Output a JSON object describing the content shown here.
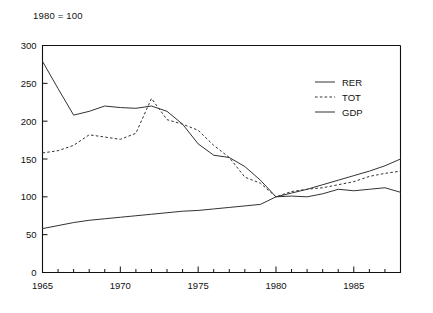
{
  "chart_data": {
    "type": "line",
    "title": "1980 = 100",
    "xlabel": "",
    "ylabel": "",
    "xlim": [
      1965,
      1988
    ],
    "ylim": [
      0,
      300
    ],
    "yticks": [
      0,
      50,
      100,
      150,
      200,
      250,
      300
    ],
    "xticks": [
      1965,
      1970,
      1975,
      1980,
      1985
    ],
    "xticks_minor_step": 1,
    "grid": false,
    "legend_position": "upper right",
    "x": [
      1965,
      1966,
      1967,
      1968,
      1969,
      1970,
      1971,
      1972,
      1973,
      1974,
      1975,
      1976,
      1977,
      1978,
      1979,
      1980,
      1981,
      1982,
      1983,
      1984,
      1985,
      1986,
      1987,
      1988
    ],
    "series": [
      {
        "name": "RER",
        "style": "solid",
        "color": "#333333",
        "values": [
          279,
          243,
          208,
          213,
          220,
          218,
          217,
          220,
          213,
          196,
          170,
          155,
          152,
          140,
          122,
          100,
          101,
          100,
          104,
          110,
          108,
          110,
          112,
          106
        ]
      },
      {
        "name": "TOT",
        "style": "dashed",
        "color": "#555555",
        "values": [
          158,
          161,
          168,
          182,
          179,
          176,
          184,
          230,
          202,
          196,
          188,
          168,
          152,
          126,
          118,
          100,
          107,
          110,
          112,
          116,
          120,
          127,
          131,
          134
        ]
      },
      {
        "name": "GDP",
        "style": "solid",
        "color": "#222222",
        "values": [
          58,
          62,
          66,
          69,
          71,
          73,
          75,
          77,
          79,
          81,
          82,
          84,
          86,
          88,
          90,
          100,
          105,
          110,
          116,
          122,
          128,
          134,
          141,
          150
        ]
      }
    ]
  },
  "legend": {
    "items": [
      {
        "label": "RER",
        "style": "solid"
      },
      {
        "label": "TOT",
        "style": "dashed"
      },
      {
        "label": "GDP",
        "style": "solid"
      }
    ]
  }
}
